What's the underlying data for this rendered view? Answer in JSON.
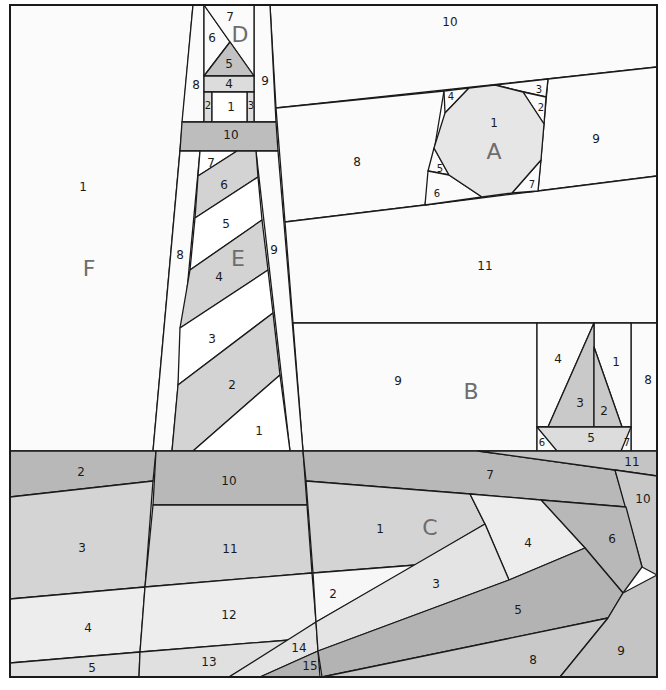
{
  "colors": {
    "white": "#ffffff",
    "offwhite": "#fbfbfb",
    "light": "#e4e4e4",
    "lighter": "#ededed",
    "mid": "#c9c9c9",
    "midlight": "#d6d6d6",
    "dark": "#b3b3b3",
    "darker": "#a9a9a9",
    "stroke": "#1a1a1a",
    "section_label": "#6d6d6d"
  },
  "sections": {
    "A": {
      "label": "A",
      "pieces": [
        "1",
        "2",
        "3",
        "4",
        "5",
        "6",
        "7",
        "8",
        "9",
        "10",
        "11"
      ]
    },
    "B": {
      "label": "B",
      "pieces": [
        "1",
        "2",
        "3",
        "4",
        "5",
        "6",
        "7",
        "8",
        "9"
      ]
    },
    "C": {
      "label": "C",
      "pieces": [
        "1",
        "2",
        "3",
        "4",
        "5",
        "6",
        "7",
        "8",
        "9",
        "10",
        "11"
      ]
    },
    "D": {
      "label": "D",
      "pieces": [
        "1",
        "2",
        "3",
        "4",
        "5",
        "6",
        "7",
        "8",
        "9",
        "10"
      ]
    },
    "E": {
      "label": "E",
      "pieces": [
        "1",
        "2",
        "3",
        "4",
        "5",
        "6",
        "7",
        "8",
        "9"
      ]
    },
    "F": {
      "label": "F",
      "pieces": [
        "1",
        "2",
        "3",
        "4",
        "5",
        "10",
        "11",
        "12",
        "13",
        "14",
        "15"
      ]
    }
  }
}
